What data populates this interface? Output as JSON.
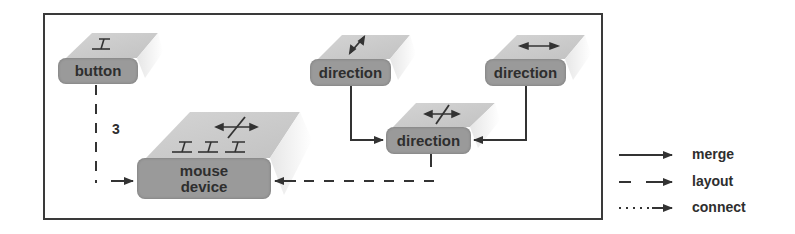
{
  "diagram": {
    "nodes": [
      {
        "id": "button",
        "label": "button",
        "icon": "text-cursor-icon"
      },
      {
        "id": "direction_diag",
        "label": "direction",
        "icon": "diagonal-double-arrow-icon"
      },
      {
        "id": "direction_horiz",
        "label": "direction",
        "icon": "horizontal-double-arrow-icon"
      },
      {
        "id": "direction_combined",
        "label": "direction",
        "icon": "combined-direction-arrows-icon"
      },
      {
        "id": "mouse_device",
        "label_line1": "mouse",
        "label_line2": "device",
        "icon": "three-cursors-and-direction-arrows-icon"
      }
    ],
    "edges": [
      {
        "from": "button",
        "to": "mouse_device",
        "type": "layout",
        "label": "3"
      },
      {
        "from": "direction_diag",
        "to": "direction_combined",
        "type": "merge"
      },
      {
        "from": "direction_horiz",
        "to": "direction_combined",
        "type": "merge"
      },
      {
        "from": "direction_combined",
        "to": "mouse_device",
        "type": "layout"
      }
    ],
    "edge_label_3": "3"
  },
  "legend": {
    "items": [
      {
        "style": "solid",
        "label": "merge"
      },
      {
        "style": "dashed",
        "label": "layout"
      },
      {
        "style": "dotted",
        "label": "connect"
      }
    ]
  }
}
